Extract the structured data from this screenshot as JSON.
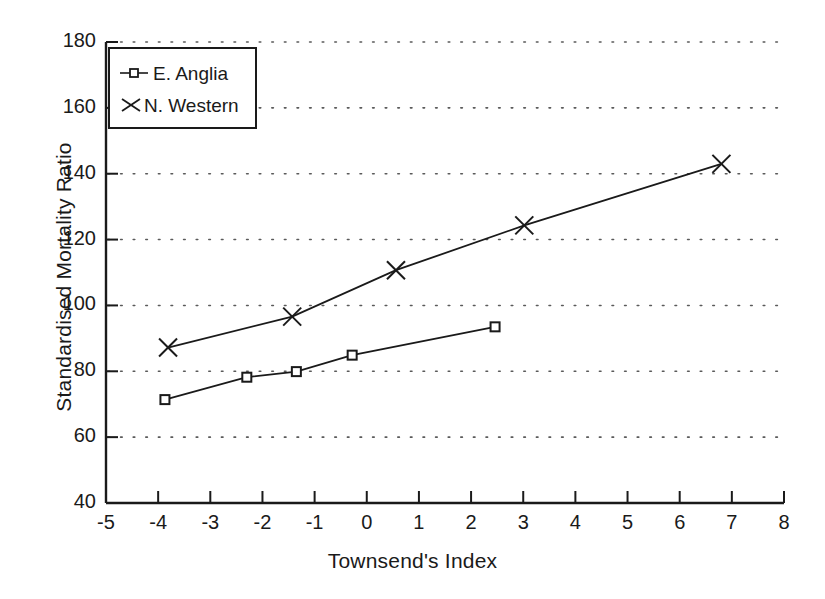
{
  "chart_data": {
    "type": "line",
    "title": "",
    "xlabel": "Townsend's Index",
    "ylabel": "Standardised Mortality Ratio",
    "xlim": [
      -5,
      8
    ],
    "ylim": [
      40,
      180
    ],
    "xticks": [
      -5,
      -4,
      -3,
      -2,
      -1,
      0,
      1,
      2,
      3,
      4,
      5,
      6,
      7,
      8
    ],
    "yticks": [
      40,
      60,
      80,
      100,
      120,
      140,
      160,
      180
    ],
    "xticklabels": [
      "-5",
      "-4",
      "-3",
      "-2",
      "-1",
      "0",
      "1",
      "2",
      "3",
      "4",
      "5",
      "6",
      "7",
      "8"
    ],
    "yticklabels": [
      "40",
      "60",
      "80",
      "100",
      "120",
      "140",
      "160",
      "180"
    ],
    "grid": "horizontal-dotted",
    "legend_position": "upper-left",
    "series": [
      {
        "name": "E. Anglia",
        "marker": "square",
        "color": "#1a1a1a",
        "points": [
          {
            "x": -3.87,
            "y": 71.4
          },
          {
            "x": -2.3,
            "y": 78.2
          },
          {
            "x": -1.35,
            "y": 79.9
          },
          {
            "x": -0.28,
            "y": 84.9
          },
          {
            "x": 2.46,
            "y": 93.5
          }
        ]
      },
      {
        "name": "N. Western",
        "marker": "x",
        "color": "#1a1a1a",
        "points": [
          {
            "x": -3.81,
            "y": 87.2
          },
          {
            "x": -1.43,
            "y": 96.6
          },
          {
            "x": 0.56,
            "y": 110.7
          },
          {
            "x": 3.02,
            "y": 124.3
          },
          {
            "x": 6.8,
            "y": 143.0
          }
        ]
      }
    ]
  },
  "legend": {
    "entries": [
      {
        "label": "E. Anglia",
        "marker": "square"
      },
      {
        "label": "N. Western",
        "marker": "x"
      }
    ]
  }
}
